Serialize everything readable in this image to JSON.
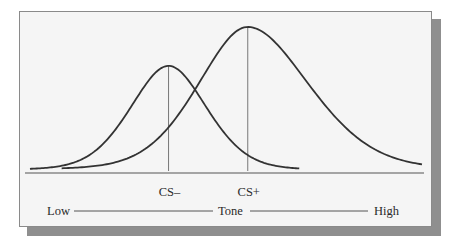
{
  "chart_data": {
    "type": "line",
    "title": "",
    "xlabel": "Tone",
    "ylabel": "",
    "axis": {
      "low_label": "Low",
      "center_label": "Tone",
      "high_label": "High"
    },
    "x_range": [
      0,
      100
    ],
    "series": [
      {
        "name": "CS-",
        "label": "CS–",
        "peak_x": 36,
        "peak_height": 0.73,
        "spread_left": 10,
        "spread_right": 10,
        "x_start": 1,
        "x_end": 69,
        "color": "#333333"
      },
      {
        "name": "CS+",
        "label": "CS+",
        "peak_x": 56,
        "peak_height": 1.0,
        "spread_left": 13,
        "spread_right": 16,
        "x_start": 9,
        "x_end": 100,
        "color": "#333333"
      }
    ],
    "markers": [
      {
        "name": "CS-",
        "x": 36
      },
      {
        "name": "CS+",
        "x": 56
      }
    ],
    "grid": false,
    "legend": "none"
  },
  "colors": {
    "panel_bg": "#f5f5f5",
    "panel_border": "#8a8a8a",
    "shadow": "#8f8f8f",
    "curve": "#333333",
    "marker_line": "#777777",
    "baseline": "#555555"
  }
}
